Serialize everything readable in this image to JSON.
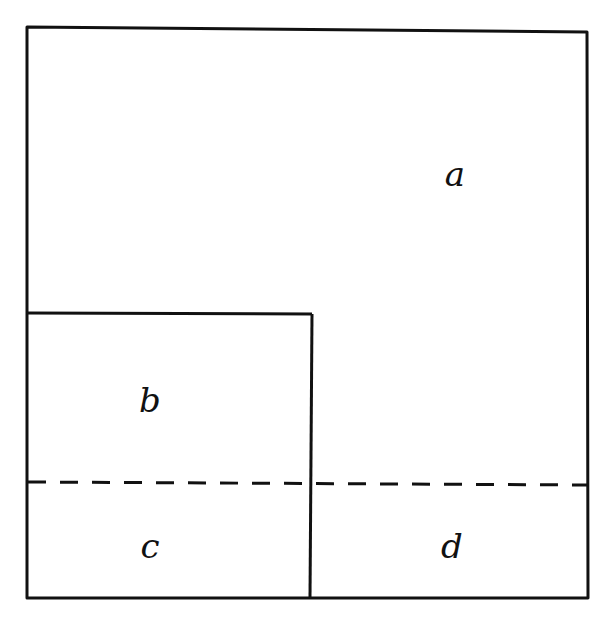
{
  "diagram": {
    "type": "area-partition",
    "style": "hand-drawn",
    "stroke_color": "#111111",
    "background": "#ffffff",
    "outer_square": {
      "x1": 27,
      "y1": 29,
      "x2": 588,
      "y2": 598
    },
    "inner_square": {
      "x1": 27,
      "y1": 313,
      "x2": 310,
      "y2": 598
    },
    "dashed_line": {
      "y": 483,
      "x1": 27,
      "x2": 588
    },
    "regions": [
      {
        "id": "a",
        "label": "a",
        "x": 455,
        "y": 186,
        "description": "outer region above/right of inner square, above dashed line"
      },
      {
        "id": "b",
        "label": "b",
        "x": 150,
        "y": 412,
        "description": "inner square above dashed line"
      },
      {
        "id": "c",
        "label": "c",
        "x": 150,
        "y": 558,
        "description": "inner square below dashed line"
      },
      {
        "id": "d",
        "label": "d",
        "x": 452,
        "y": 558,
        "description": "right strip below dashed line"
      }
    ]
  }
}
